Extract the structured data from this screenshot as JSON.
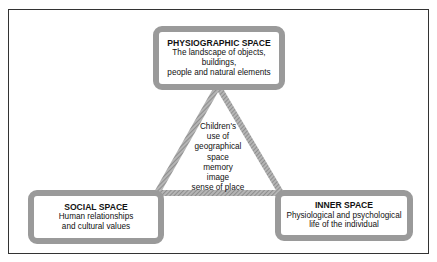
{
  "diagram": {
    "colors": {
      "frame": "#333333",
      "hatch": "#9a9a9a",
      "text": "#111111"
    },
    "top_box": {
      "title": "PHYSIOGRAPHIC SPACE",
      "lines": [
        "The landscape of objects,",
        "buildings,",
        "people and natural elements"
      ]
    },
    "left_box": {
      "title": "SOCIAL SPACE",
      "lines": [
        "Human relationships",
        "and cultural values"
      ]
    },
    "right_box": {
      "title": "INNER SPACE",
      "lines": [
        "Physiological and psychological",
        "life of the individual"
      ]
    },
    "center": {
      "lines": [
        "Children's",
        "use of",
        "geographical",
        "space",
        "memory",
        "image",
        "sense of place"
      ]
    }
  }
}
